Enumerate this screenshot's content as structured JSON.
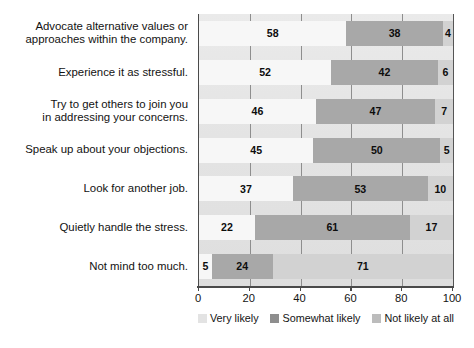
{
  "chart_data": {
    "type": "bar",
    "orientation": "horizontal",
    "stacked": true,
    "title": "",
    "xlabel": "",
    "ylabel": "",
    "xlim": [
      0,
      100
    ],
    "grid": true,
    "legend_position": "bottom",
    "categories": [
      "Advocate alternative values or approaches within the company.",
      "Experience it as stressful.",
      "Try to get others to join you in addressing your concerns.",
      "Speak up about your objections.",
      "Look for another job.",
      "Quietly handle the stress.",
      "Not mind too much."
    ],
    "category_lines": [
      [
        "Advocate alternative values or",
        "approaches within the company."
      ],
      [
        "Experience it as stressful."
      ],
      [
        "Try to get others to join you",
        "in addressing your concerns."
      ],
      [
        "Speak up about your objections."
      ],
      [
        "Look for another job."
      ],
      [
        "Quietly handle the stress."
      ],
      [
        "Not mind too much."
      ]
    ],
    "series": [
      {
        "name": "Very likely",
        "color": "#f7f7f7",
        "values": [
          58,
          52,
          46,
          45,
          37,
          22,
          5
        ]
      },
      {
        "name": "Somewhat likely",
        "color": "#a8a8a8",
        "values": [
          38,
          42,
          47,
          50,
          53,
          61,
          24
        ]
      },
      {
        "name": "Not likely at all",
        "color": "#d2d2d2",
        "values": [
          4,
          6,
          7,
          5,
          10,
          17,
          71
        ]
      }
    ],
    "xticks": [
      0,
      20,
      40,
      60,
      80,
      100
    ],
    "xticklabels": [
      "0",
      "20",
      "40",
      "60",
      "80",
      "100"
    ]
  },
  "legend": {
    "items": [
      {
        "label": "Very likely"
      },
      {
        "label": "Somewhat likely"
      },
      {
        "label": "Not likely at all"
      }
    ]
  }
}
